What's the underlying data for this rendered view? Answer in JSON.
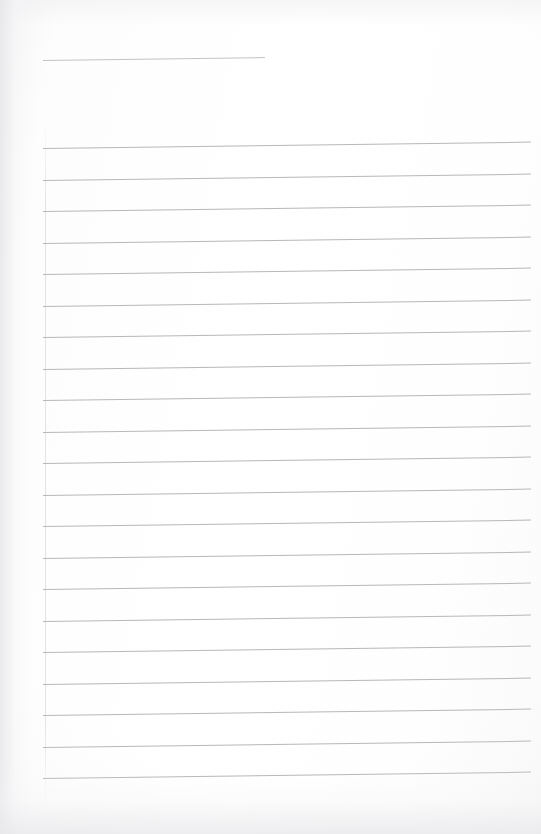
{
  "document": {
    "kind": "scanned-blank-ruled-page",
    "title": "",
    "body_text": "",
    "page_number": "",
    "width_px": 541,
    "height_px": 834
  },
  "appearance": {
    "paper_color": "#fdfdfd",
    "rule_color": "#b3b3b8",
    "header_rule_color": "#bdbdc2",
    "shadow_color": "#e6e6e9"
  },
  "layout": {
    "rule_left_px": 43,
    "rule_right_px": 531,
    "rule_spacing_px": 31.5,
    "skew_deg": -0.75,
    "header_rule": {
      "left_px": 43,
      "width_px": 222,
      "top_px": 60
    },
    "body_rules_top_px": 148,
    "body_rule_count": 21
  },
  "content": {
    "lines": [
      {
        "index": 1,
        "text": ""
      },
      {
        "index": 2,
        "text": ""
      },
      {
        "index": 3,
        "text": ""
      },
      {
        "index": 4,
        "text": ""
      },
      {
        "index": 5,
        "text": ""
      },
      {
        "index": 6,
        "text": ""
      },
      {
        "index": 7,
        "text": ""
      },
      {
        "index": 8,
        "text": ""
      },
      {
        "index": 9,
        "text": ""
      },
      {
        "index": 10,
        "text": ""
      },
      {
        "index": 11,
        "text": ""
      },
      {
        "index": 12,
        "text": ""
      },
      {
        "index": 13,
        "text": ""
      },
      {
        "index": 14,
        "text": ""
      },
      {
        "index": 15,
        "text": ""
      },
      {
        "index": 16,
        "text": ""
      },
      {
        "index": 17,
        "text": ""
      },
      {
        "index": 18,
        "text": ""
      },
      {
        "index": 19,
        "text": ""
      },
      {
        "index": 20,
        "text": ""
      },
      {
        "index": 21,
        "text": ""
      }
    ]
  }
}
